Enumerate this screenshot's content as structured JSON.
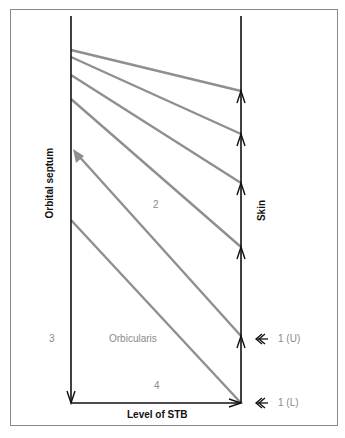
{
  "diagram": {
    "labels": {
      "orbital_septum": "Orbital septum",
      "skin": "Skin",
      "region_2": "2",
      "region_3": "3",
      "orbicularis": "Orbicularis",
      "region_4": "4",
      "level_of_stb": "Level of STB",
      "marker_upper": "1 (U)",
      "marker_lower": "1 (L)"
    },
    "colors": {
      "axis_line": "#111111",
      "fibre_line": "#8f8f8f",
      "label_gray": "#8a8a8a",
      "frame": "#8a8a8a"
    },
    "fibres": [
      {
        "from": [
          71,
          50
        ],
        "to": [
          241,
          91
        ]
      },
      {
        "from": [
          71,
          57
        ],
        "to": [
          241,
          134
        ]
      },
      {
        "from": [
          71,
          75
        ],
        "to": [
          241,
          183
        ]
      },
      {
        "from": [
          71,
          99
        ],
        "to": [
          241,
          247
        ]
      },
      {
        "from": [
          241,
          336
        ],
        "to": [
          74,
          150
        ],
        "arrow": true
      },
      {
        "from": [
          71,
          220
        ],
        "to": [
          241,
          403
        ]
      }
    ]
  }
}
